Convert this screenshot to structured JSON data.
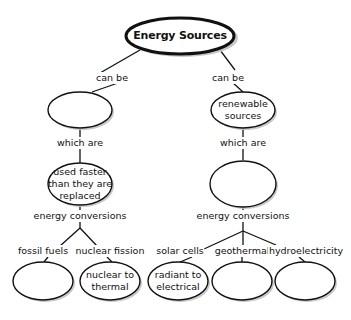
{
  "diagram": {
    "title": "Energy Sources",
    "root": {
      "label": "Energy Sources"
    },
    "links": {
      "left_can_be": "can be",
      "right_can_be": "can be",
      "left_which_are": "which are",
      "right_which_are": "which are",
      "left_energy_conversions": "energy conversions",
      "right_energy_conversions": "energy conversions",
      "fossil_fuels": "fossil fuels",
      "nuclear_fission": "nuclear fission",
      "solar_cells": "solar cells",
      "geothermal": "geothermal",
      "hydroelectricity": "hydroelectricity"
    },
    "nodes": {
      "left_type": "",
      "right_type": "renewable\nsources",
      "left_property": "used faster\nthan they are\nreplaced",
      "right_property": "",
      "fossil_conversion": "",
      "nuclear_conversion": "nuclear to\nthermal",
      "solar_conversion": "radiant to\nelectrical",
      "geothermal_conversion": "",
      "hydro_conversion": ""
    },
    "colors": {
      "stroke": "#111111",
      "fill": "#ffffff",
      "shadow": "#bdbdbd"
    }
  }
}
